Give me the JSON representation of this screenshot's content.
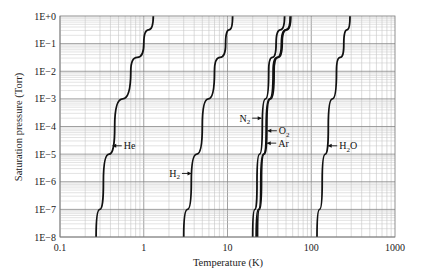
{
  "chart_data": {
    "type": "line",
    "title": "",
    "xlabel": "Temperature (K)",
    "ylabel": "Saturation pressure (Torr)",
    "xscale": "log",
    "yscale": "log",
    "xlim": [
      0.1,
      1000
    ],
    "ylim": [
      1e-08,
      1
    ],
    "grid": true,
    "legend": "inline arrow labels",
    "x_ticks": [
      "0.1",
      "1",
      "10",
      "100",
      "1000"
    ],
    "y_ticks": [
      "1E+0",
      "1E−1",
      "1E−2",
      "1E−3",
      "1E−4",
      "1E−5",
      "1E−6",
      "1E−7",
      "1E−8"
    ],
    "series": [
      {
        "name": "He",
        "label": "He",
        "sub": "",
        "x": [
          0.27,
          0.33,
          0.45,
          0.7,
          1.0,
          1.3
        ],
        "y": [
          1e-08,
          1e-06,
          0.0001,
          0.01,
          0.1,
          1
        ]
      },
      {
        "name": "H2",
        "label": "H",
        "sub": "2",
        "x": [
          3.0,
          3.7,
          5.0,
          7.0,
          9.5,
          11.5
        ],
        "y": [
          1e-08,
          1e-06,
          0.0001,
          0.01,
          0.1,
          1
        ]
      },
      {
        "name": "N2",
        "label": "N",
        "sub": "2",
        "x": [
          20,
          22.5,
          26,
          31,
          38,
          48
        ],
        "y": [
          1e-08,
          1e-06,
          0.0001,
          0.01,
          0.1,
          1
        ]
      },
      {
        "name": "O2",
        "label": "O",
        "sub": "2",
        "x": [
          22,
          25,
          29,
          35,
          44,
          56
        ],
        "y": [
          1e-08,
          1e-06,
          0.0001,
          0.01,
          0.1,
          1
        ]
      },
      {
        "name": "Ar",
        "label": "Ar",
        "sub": "",
        "x": [
          22.8,
          25.5,
          29.5,
          36,
          45,
          57
        ],
        "y": [
          1e-08,
          1e-06,
          0.0001,
          0.01,
          0.1,
          1
        ]
      },
      {
        "name": "H2O",
        "label": "H",
        "sub": "2",
        "suffix": "O",
        "x": [
          117,
          135,
          160,
          200,
          245,
          290
        ],
        "y": [
          1e-08,
          1e-06,
          0.0001,
          0.01,
          0.1,
          1
        ]
      }
    ],
    "annotations": [
      {
        "text": "He",
        "arrow_to": "He",
        "at_y": 2e-05
      },
      {
        "text": "H2",
        "arrow_to": "H2",
        "at_y": 2e-06
      },
      {
        "text": "N2",
        "arrow_to": "N2",
        "at_y": 0.0002
      },
      {
        "text": "O2",
        "arrow_to": "O2",
        "at_y": 7e-05
      },
      {
        "text": "Ar",
        "arrow_to": "Ar",
        "at_y": 2.5e-05
      },
      {
        "text": "H2O",
        "arrow_to": "H2O",
        "at_y": 2e-05
      }
    ]
  }
}
